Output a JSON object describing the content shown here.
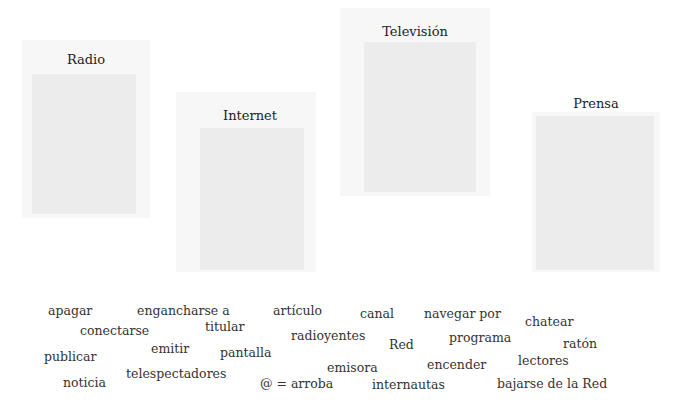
{
  "panels": {
    "radio": {
      "title": "Radio"
    },
    "internet": {
      "title": "Internet"
    },
    "television": {
      "title": "Televisión"
    },
    "prensa": {
      "title": "Prensa"
    }
  },
  "word_bank": [
    {
      "text": "apagar",
      "x": 48,
      "y": 303
    },
    {
      "text": "engancharse a",
      "x": 137,
      "y": 303
    },
    {
      "text": "artículo",
      "x": 273,
      "y": 303
    },
    {
      "text": "canal",
      "x": 360,
      "y": 306
    },
    {
      "text": "navegar por",
      "x": 424,
      "y": 306
    },
    {
      "text": "chatear",
      "x": 525,
      "y": 314
    },
    {
      "text": "conectarse",
      "x": 80,
      "y": 323
    },
    {
      "text": "titular",
      "x": 205,
      "y": 319
    },
    {
      "text": "radioyentes",
      "x": 291,
      "y": 328
    },
    {
      "text": "Red",
      "x": 389,
      "y": 337
    },
    {
      "text": "programa",
      "x": 449,
      "y": 330
    },
    {
      "text": "ratón",
      "x": 563,
      "y": 336
    },
    {
      "text": "publicar",
      "x": 44,
      "y": 349
    },
    {
      "text": "emitir",
      "x": 151,
      "y": 341
    },
    {
      "text": "pantalla",
      "x": 220,
      "y": 345
    },
    {
      "text": "emisora",
      "x": 327,
      "y": 360
    },
    {
      "text": "encender",
      "x": 427,
      "y": 357
    },
    {
      "text": "lectores",
      "x": 518,
      "y": 353
    },
    {
      "text": "noticia",
      "x": 63,
      "y": 375
    },
    {
      "text": "telespectadores",
      "x": 126,
      "y": 366
    },
    {
      "text": "@ = arroba",
      "x": 260,
      "y": 376
    },
    {
      "text": "internautas",
      "x": 372,
      "y": 377
    },
    {
      "text": "bajarse de la Red",
      "x": 497,
      "y": 376
    }
  ]
}
